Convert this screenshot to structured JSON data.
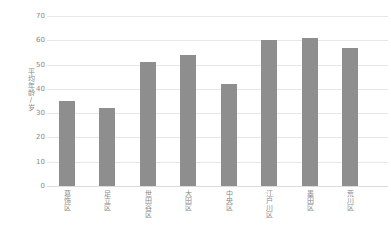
{
  "chart_data": {
    "type": "bar",
    "categories": [
      "葛饰区",
      "足立区",
      "世田谷区",
      "大田区",
      "中央区",
      "江户川区",
      "墨田区",
      "荒川区"
    ],
    "values": [
      35,
      32,
      51,
      54,
      42,
      60,
      61,
      57
    ],
    "title": "",
    "xlabel": "",
    "ylabel": "平均年龄/岁",
    "ylim": [
      0,
      70
    ],
    "yticks": [
      0,
      10,
      20,
      30,
      40,
      50,
      60,
      70
    ],
    "grid": true,
    "legend": "none",
    "bar_color": "#8e8e8e",
    "gridline_color": "#e7e7e7",
    "tick_label_color": "#8a8a8a",
    "background_color": "#ffffff"
  }
}
